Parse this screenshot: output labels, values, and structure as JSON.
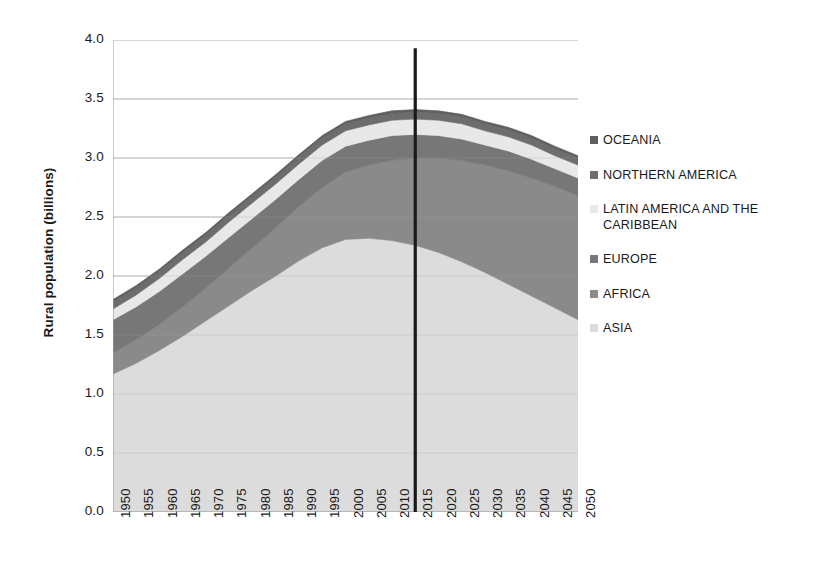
{
  "chart_data": {
    "type": "area",
    "title": "",
    "subtitle": "",
    "xlabel": "",
    "ylabel": "Rural population (billions)",
    "ylim": [
      0.0,
      4.0
    ],
    "ytick_labels": [
      "4.0",
      "3.5",
      "3.0",
      "2.5",
      "2.0",
      "1.5",
      "1.0",
      "0.5",
      "0.0"
    ],
    "ytick_values": [
      4.0,
      3.5,
      3.0,
      2.5,
      2.0,
      1.5,
      1.0,
      0.5,
      0.0
    ],
    "grid": "horizontal",
    "stacked": true,
    "legend_position": "right",
    "legend_order": [
      "OCEANIA",
      "NORTHERN AMERICA",
      "LATIN AMERICA AND THE CARIBBEAN",
      "EUROPE",
      "AFRICA",
      "ASIA"
    ],
    "x": [
      1950,
      1955,
      1960,
      1965,
      1970,
      1975,
      1980,
      1985,
      1990,
      1995,
      2000,
      2005,
      2010,
      2015,
      2020,
      2025,
      2030,
      2035,
      2040,
      2045,
      2050
    ],
    "categories": [
      "1950",
      "1955",
      "1960",
      "1965",
      "1970",
      "1975",
      "1980",
      "1985",
      "1990",
      "1995",
      "2000",
      "2005",
      "2010",
      "2015",
      "2020",
      "2025",
      "2030",
      "2035",
      "2040",
      "2045",
      "2050"
    ],
    "series": [
      {
        "name": "ASIA",
        "color": "#dcdcdc",
        "values": [
          1.17,
          1.26,
          1.37,
          1.49,
          1.62,
          1.75,
          1.88,
          2.0,
          2.13,
          2.24,
          2.31,
          2.32,
          2.3,
          2.26,
          2.2,
          2.12,
          2.03,
          1.93,
          1.83,
          1.73,
          1.63
        ]
      },
      {
        "name": "AFRICA",
        "color": "#8a8a8a",
        "values": [
          0.18,
          0.2,
          0.22,
          0.25,
          0.28,
          0.32,
          0.36,
          0.41,
          0.46,
          0.51,
          0.57,
          0.62,
          0.68,
          0.74,
          0.8,
          0.86,
          0.91,
          0.96,
          1.0,
          1.03,
          1.05
        ]
      },
      {
        "name": "EUROPE",
        "color": "#777777",
        "values": [
          0.28,
          0.28,
          0.28,
          0.28,
          0.27,
          0.26,
          0.25,
          0.24,
          0.23,
          0.23,
          0.22,
          0.21,
          0.21,
          0.2,
          0.19,
          0.18,
          0.17,
          0.17,
          0.16,
          0.15,
          0.15
        ]
      },
      {
        "name": "LATIN AMERICA AND THE CARIBBEAN",
        "color": "#e8e8e8",
        "values": [
          0.09,
          0.1,
          0.11,
          0.12,
          0.12,
          0.13,
          0.13,
          0.13,
          0.13,
          0.13,
          0.13,
          0.13,
          0.13,
          0.13,
          0.13,
          0.13,
          0.12,
          0.12,
          0.12,
          0.11,
          0.11
        ]
      },
      {
        "name": "NORTHERN AMERICA",
        "color": "#6d6d6d",
        "values": [
          0.06,
          0.06,
          0.06,
          0.06,
          0.06,
          0.06,
          0.06,
          0.06,
          0.06,
          0.06,
          0.06,
          0.06,
          0.06,
          0.06,
          0.06,
          0.06,
          0.06,
          0.06,
          0.06,
          0.06,
          0.06
        ]
      },
      {
        "name": "OCEANIA",
        "color": "#5f5f5f",
        "values": [
          0.02,
          0.02,
          0.02,
          0.02,
          0.02,
          0.02,
          0.02,
          0.02,
          0.02,
          0.02,
          0.02,
          0.02,
          0.02,
          0.02,
          0.02,
          0.02,
          0.02,
          0.02,
          0.02,
          0.02,
          0.02
        ]
      }
    ],
    "annotations": [
      {
        "name": "year-marker-2015",
        "type": "vline",
        "x": 2015,
        "y_top": 3.93,
        "y_bottom": 0.0,
        "color": "#1a1a1a",
        "label": ""
      }
    ],
    "totals": [
      1.8,
      1.92,
      2.06,
      2.22,
      2.37,
      2.54,
      2.7,
      2.86,
      3.03,
      3.19,
      3.31,
      3.36,
      3.4,
      3.41,
      3.4,
      3.37,
      3.31,
      3.26,
      3.19,
      3.1,
      3.02
    ]
  },
  "axes": {
    "y_title": "Rural population (billions)",
    "y_ticks": [
      "4.0",
      "3.5",
      "3.0",
      "2.5",
      "2.0",
      "1.5",
      "1.0",
      "0.5",
      "0.0"
    ],
    "x_ticks": [
      "1950",
      "1955",
      "1960",
      "1965",
      "1970",
      "1975",
      "1980",
      "1985",
      "1990",
      "1995",
      "2000",
      "2005",
      "2010",
      "2015",
      "2020",
      "2025",
      "2030",
      "2035",
      "2040",
      "2045",
      "2050"
    ]
  },
  "legend": {
    "items": [
      {
        "label": "OCEANIA",
        "color": "#5f5f5f"
      },
      {
        "label": "NORTHERN AMERICA",
        "color": "#6d6d6d"
      },
      {
        "label": "LATIN AMERICA AND THE CARIBBEAN",
        "color": "#e8e8e8"
      },
      {
        "label": "EUROPE",
        "color": "#777777"
      },
      {
        "label": "AFRICA",
        "color": "#8a8a8a"
      },
      {
        "label": "ASIA",
        "color": "#dcdcdc"
      }
    ]
  },
  "colors": {
    "axis": "#9a9a9a",
    "grid": "#b5b5b5",
    "text": "#1a1a1a",
    "marker_line": "#1a1a1a",
    "background": "#ffffff"
  }
}
